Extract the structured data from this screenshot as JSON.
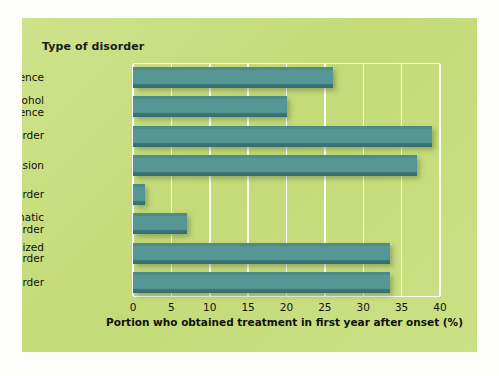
{
  "figure": {
    "panel_title": "Type of disorder",
    "background_color": "#c8de80",
    "bar_color": "#4e8c8b",
    "gridline_color": "#ffffff"
  },
  "chart_data": {
    "type": "bar",
    "orientation": "horizontal",
    "title": "Type of disorder",
    "xlabel": "Portion who obtained treatment in first year after onset (%)",
    "ylabel": "Type of disorder",
    "categories": [
      "Drug dependence",
      "Alcohol dependence",
      "Bipolar disorder",
      "Major depression",
      "Phobic disorder",
      "Posttraumatic stress disorder",
      "Generalized anxiety disorder",
      "Panic disorder"
    ],
    "category_label_lines": [
      [
        "Drug dependence"
      ],
      [
        "Alcohol",
        "dependence"
      ],
      [
        "Bipolar disorder"
      ],
      [
        "Major depression"
      ],
      [
        "Phobic disorder"
      ],
      [
        "Posttraumatic",
        "stress disorder"
      ],
      [
        "Generalized",
        "anxiety disorder"
      ],
      [
        "Panic disorder"
      ]
    ],
    "values": [
      26,
      20,
      39,
      37,
      1.5,
      7,
      33.5,
      33.5
    ],
    "xlim": [
      0,
      40
    ],
    "xticks": [
      0,
      5,
      10,
      15,
      20,
      25,
      30,
      35,
      40
    ],
    "xtick_labels": [
      "0",
      "5",
      "10",
      "15",
      "20",
      "25",
      "30",
      "35",
      "40"
    ],
    "grid": true,
    "grid_axis": "x",
    "legend": false
  }
}
